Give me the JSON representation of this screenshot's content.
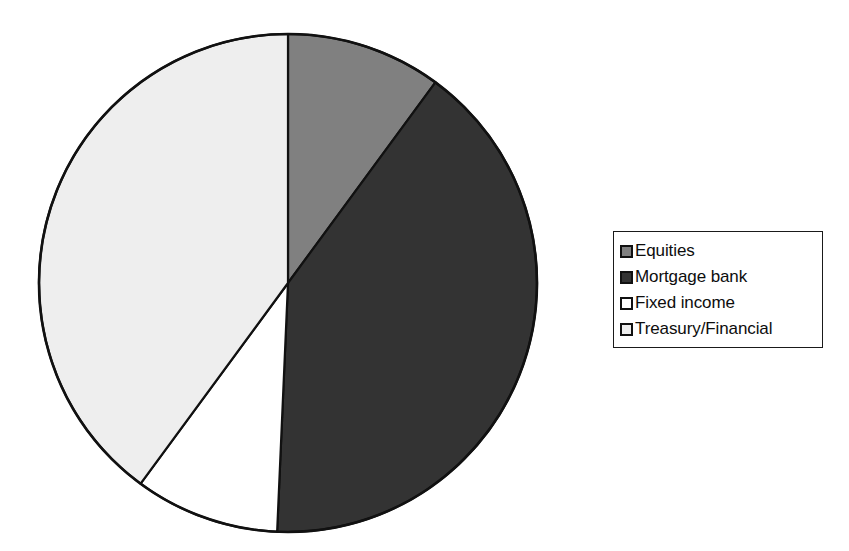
{
  "chart_data": {
    "type": "pie",
    "title": "",
    "subtitle": "",
    "xlabel": "",
    "ylabel": "",
    "grid": false,
    "legend_position": "right",
    "start_angle_deg": 0,
    "direction": "clockwise",
    "categories": [
      "Equities",
      "Mortgage bank",
      "Fixed income",
      "Treasury/Financial"
    ],
    "values": [
      10.1,
      40.6,
      9.4,
      39.9
    ],
    "slices": [
      {
        "label": "Equities",
        "value": 10.1,
        "start_angle_deg": 0.0,
        "end_angle_deg": 36.3,
        "color": "#808080",
        "edge_color": "#111111"
      },
      {
        "label": "Mortgage bank",
        "value": 40.6,
        "start_angle_deg": 36.3,
        "end_angle_deg": 182.5,
        "color": "#333333",
        "edge_color": "#111111"
      },
      {
        "label": "Fixed income",
        "value": 9.4,
        "start_angle_deg": 182.5,
        "end_angle_deg": 216.3,
        "color": "#ffffff",
        "edge_color": "#111111"
      },
      {
        "label": "Treasury/Financial",
        "value": 39.9,
        "start_angle_deg": 216.3,
        "end_angle_deg": 360.0,
        "color": "#eeeeee",
        "edge_color": "#111111"
      }
    ],
    "geometry": {
      "center_x": 288,
      "center_y": 283,
      "radius": 249
    }
  },
  "legend": {
    "border_color": "#1a1a1a",
    "background": "#ffffff",
    "items": [
      {
        "label": "Equities",
        "swatch_color": "#808080",
        "swatch_name": "legend-swatch-equities"
      },
      {
        "label": "Mortgage bank",
        "swatch_color": "#333333",
        "swatch_name": "legend-swatch-mortgage-bank"
      },
      {
        "label": "Fixed income",
        "swatch_color": "#ffffff",
        "swatch_name": "legend-swatch-fixed-income"
      },
      {
        "label": "Treasury/Financial",
        "swatch_color": "#eeeeee",
        "swatch_name": "legend-swatch-treasury-financial"
      }
    ]
  },
  "colors": {
    "background": "#ffffff",
    "outline": "#111111",
    "equities": "#808080",
    "mortgage_bank": "#333333",
    "fixed_income": "#ffffff",
    "treasury_financial": "#eeeeee"
  }
}
